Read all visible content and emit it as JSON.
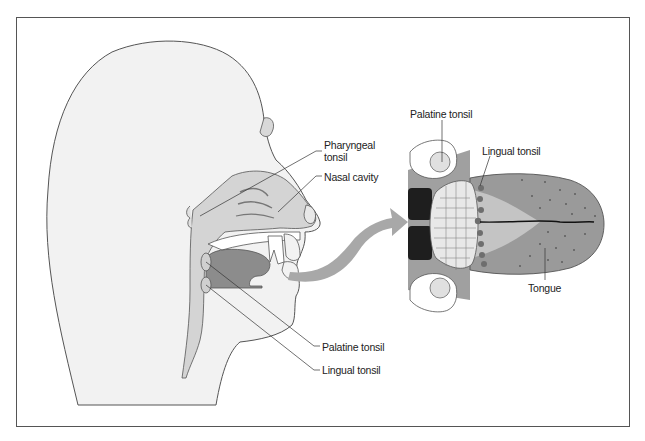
{
  "figure": {
    "colors": {
      "skin_fill": "#f2f2f2",
      "outline": "#555555",
      "cavity_fill": "#d4d4d4",
      "tongue_fill": "#8c8c8c",
      "tongue_top_fill": "#9a9a9a",
      "arrow": "#a8a8a8",
      "pharynx_dark": "#1e1e1e",
      "lingual_tonsil_dots": "#6e6e6e"
    }
  },
  "head_section": {
    "labels": [
      {
        "id": "pharyngeal-tonsil",
        "text": "Pharyngeal\ntonsil",
        "line1": "Pharyngeal",
        "line2": "tonsil"
      },
      {
        "id": "nasal-cavity",
        "text": "Nasal cavity"
      },
      {
        "id": "palatine-tonsil",
        "text": "Palatine tonsil"
      },
      {
        "id": "lingual-tonsil",
        "text": "Lingual tonsil"
      }
    ]
  },
  "tongue_view": {
    "labels": [
      {
        "id": "palatine-tonsil",
        "text": "Palatine tonsil"
      },
      {
        "id": "lingual-tonsil",
        "text": "Lingual tonsil"
      },
      {
        "id": "tongue",
        "text": "Tongue"
      }
    ]
  }
}
